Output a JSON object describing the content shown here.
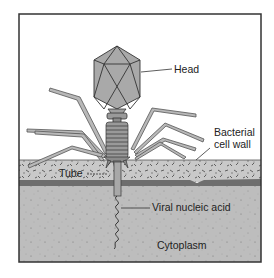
{
  "diagram": {
    "labels": {
      "head": "Head",
      "cell_wall_line1": "Bacterial",
      "cell_wall_line2": "cell wall",
      "tube": "Tube",
      "nucleic_acid": "Viral nucleic acid",
      "cytoplasm": "Cytoplasm"
    },
    "colors": {
      "frame": "#333333",
      "head_fill": "#a9a9a9",
      "sheath_fill": "#9a9a9a",
      "fiber_fill": "#b8b8b8",
      "cell_wall_fill": "#c4c4c4",
      "membrane_band": "#6e6e6e",
      "cytoplasm_fill": "#bdbdbd",
      "background": "#ffffff"
    }
  }
}
